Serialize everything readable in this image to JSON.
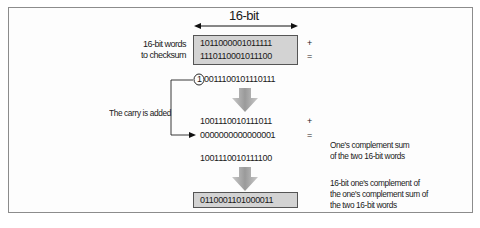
{
  "diagram": {
    "width_label": "16-bit",
    "words_label_line1": "16-bit words",
    "words_label_line2": "to checksum",
    "word1": "1011000001011111",
    "word2": "1110110001011100",
    "plus": "+",
    "equals": "=",
    "carry_bit": "1",
    "raw_sum": "0011100101110111",
    "raw_sum_display": "0011100101110111",
    "carry_label": "The carry is added",
    "sum_without_carry": "1001110010111011",
    "carry_word": "0000000000000001",
    "ones_complement_sum": "1001110010111100",
    "ones_complement_sum_label_line1": "One's complement sum",
    "ones_complement_sum_label_line2": "of the two 16-bit words",
    "checksum": "0110001101000011",
    "checksum_label_line1": "16-bit one's complement of",
    "checksum_label_line2": "the one's complement sum of",
    "checksum_label_line3": "the two 16-bit words",
    "colors": {
      "box_fill": "#d3d3d3",
      "arrow_fill": "#a8a8a8",
      "frame": "#8c8c8c"
    }
  }
}
